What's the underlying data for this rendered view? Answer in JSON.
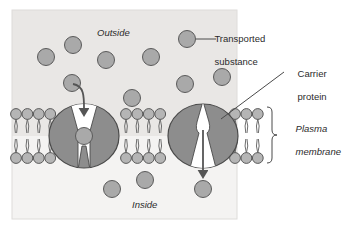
{
  "figure": {
    "width": 345,
    "height": 229,
    "panel": {
      "x": 12,
      "y": 10,
      "width": 225,
      "height": 209
    }
  },
  "colors": {
    "page_background": "#ffffff",
    "outside_background": "#e9e7e5",
    "inside_background": "#f4f3f2",
    "panel_border": "#d8d6d4",
    "protein_fill": "#8d8d8d",
    "protein_stroke": "#4a4a4a",
    "substance_fill": "#a9a9a9",
    "substance_stroke": "#5a5a5a",
    "lipid_head_fill": "#b5b5b5",
    "lipid_head_stroke": "#5a5a5a",
    "lipid_tail_stroke": "#6e6e6e",
    "channel_fill": "#ffffff",
    "arrow_color": "#555555",
    "leader_line": "#4a4a4a",
    "text": "#2b2b2b"
  },
  "labels": {
    "outside": {
      "text": "Outside",
      "style": "italic",
      "x": 97,
      "y": 33
    },
    "inside": {
      "text": "Inside",
      "style": "italic",
      "x": 132,
      "y": 205
    },
    "transported_substance": {
      "line1": "Transported",
      "line2": "substance",
      "x": 204,
      "y": 26
    },
    "carrier_protein": {
      "line1": "Carrier",
      "line2": "protein",
      "x": 287,
      "y": 62
    },
    "plasma_membrane": {
      "line1": "Plasma",
      "line2": "membrane",
      "style": "italic",
      "x": 293,
      "y": 117
    }
  },
  "membrane": {
    "top_y": 114,
    "bottom_y": 158,
    "head_radius": 5.4,
    "segments": [
      {
        "name": "left-bilayer-segment",
        "start_x": 16,
        "count": 4,
        "spacing": 11.4
      },
      {
        "name": "middle-bilayer-segment",
        "start_x": 126,
        "count": 4,
        "spacing": 11.4
      },
      {
        "name": "right-bilayer-segment",
        "start_x": 235,
        "count": 3,
        "spacing": 11.4
      }
    ],
    "bracket": {
      "x": 272,
      "top_y": 110,
      "bottom_y": 163
    }
  },
  "carrier_proteins": [
    {
      "name": "left-carrier-protein",
      "cx": 84,
      "cy": 136,
      "rx": 35,
      "ry": 32,
      "channel": "open-outside",
      "bound_substance": {
        "cx": 84,
        "cy": 136,
        "r": 8.5
      }
    },
    {
      "name": "right-carrier-protein",
      "cx": 203,
      "cy": 136,
      "rx": 35,
      "ry": 32,
      "channel": "open-inside",
      "bound_substance": null
    }
  ],
  "transport_arrows": [
    {
      "name": "uptake-arrow",
      "description": "curved arrow from outside substance down into left carrier protein channel",
      "path": "M 73 84 C 85 86 84 98 84 112",
      "head_at": {
        "x": 84,
        "y": 118
      }
    },
    {
      "name": "release-arrow",
      "description": "straight arrow from right carrier protein channel down into inside",
      "path": "M 203 130 L 203 174",
      "head_at": {
        "x": 203,
        "y": 180
      }
    }
  ],
  "substance_particles": {
    "radius": 8.5,
    "outside": [
      {
        "cx": 46,
        "cy": 57
      },
      {
        "cx": 73,
        "cy": 45
      },
      {
        "cx": 72,
        "cy": 83
      },
      {
        "cx": 106,
        "cy": 60
      },
      {
        "cx": 132,
        "cy": 98
      },
      {
        "cx": 151,
        "cy": 57
      },
      {
        "cx": 185,
        "cy": 84
      },
      {
        "cx": 187,
        "cy": 39
      },
      {
        "cx": 222,
        "cy": 77
      }
    ],
    "inside": [
      {
        "cx": 112,
        "cy": 189
      },
      {
        "cx": 145,
        "cy": 180
      },
      {
        "cx": 203,
        "cy": 189
      }
    ],
    "legend_marker": {
      "cx": 187,
      "cy": 39,
      "r": 8.5
    }
  },
  "leaders": [
    {
      "name": "transported-substance-leader",
      "from": {
        "x": 196,
        "y": 39
      },
      "to": {
        "x": 215,
        "y": 39
      }
    },
    {
      "name": "carrier-protein-leader",
      "from": {
        "x": 221,
        "y": 119
      },
      "to": {
        "x": 284,
        "y": 72
      }
    }
  ]
}
